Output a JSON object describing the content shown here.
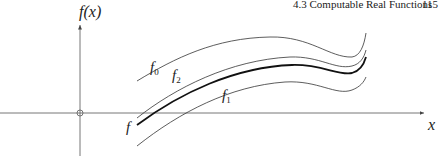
{
  "header": {
    "section_title": "4.3 Computable Real Functions",
    "page_number": "115"
  },
  "figure": {
    "y_axis_label": "f(x)",
    "x_axis_label": "x",
    "curves": [
      {
        "name": "f",
        "label_main": "f",
        "label_sub": "",
        "style": "thick"
      },
      {
        "name": "f0",
        "label_main": "f",
        "label_sub": "0",
        "style": "thin"
      },
      {
        "name": "f1",
        "label_main": "f",
        "label_sub": "1",
        "style": "thin"
      },
      {
        "name": "f2",
        "label_main": "f",
        "label_sub": "2",
        "style": "thin"
      }
    ],
    "colors": {
      "axis": "#555555",
      "curve": "#333333",
      "curve_thick": "#111111"
    }
  }
}
